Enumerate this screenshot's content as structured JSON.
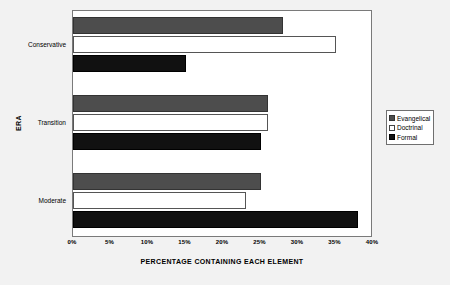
{
  "chart_data": {
    "type": "bar",
    "orientation": "horizontal",
    "title": "",
    "xlabel": "PERCENTAGE CONTAINING EACH ELEMENT",
    "ylabel": "ERA",
    "categories": [
      "Conservative",
      "Transition",
      "Moderate"
    ],
    "series": [
      {
        "name": "Evangelical",
        "color": "#4d4d4d",
        "values": [
          28,
          26,
          25
        ]
      },
      {
        "name": "Doctrinal",
        "color": "#ffffff",
        "values": [
          35,
          26,
          23
        ]
      },
      {
        "name": "Formal",
        "color": "#111111",
        "values": [
          15,
          25,
          38
        ]
      }
    ],
    "xlim": [
      0,
      40
    ],
    "xticks": [
      "0%",
      "5%",
      "10%",
      "15%",
      "20%",
      "25%",
      "30%",
      "35%",
      "40%"
    ],
    "xtick_values": [
      0,
      5,
      10,
      15,
      20,
      25,
      30,
      35,
      40
    ],
    "grid": false,
    "legend_position": "right"
  },
  "legend": {
    "items": [
      {
        "label": "Evangelical"
      },
      {
        "label": "Doctrinal"
      },
      {
        "label": "Formal"
      }
    ]
  },
  "axes": {
    "x_title": "PERCENTAGE CONTAINING EACH ELEMENT",
    "y_title": "ERA"
  }
}
